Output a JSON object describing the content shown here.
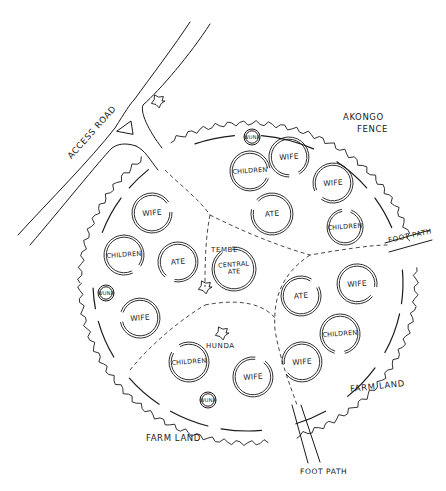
{
  "diagram": {
    "title": "",
    "stroke_color": "#1a1a1a",
    "background": "#ffffff",
    "labels": {
      "access_road": "ACCESS ROAD",
      "akongo_fence_line1": "AKONGO",
      "akongo_fence_line2": "FENCE",
      "foot_path_right": "FOOT PATH",
      "foot_path_bottom": "FOOT PATH",
      "farm_land_right": "FARM LAND",
      "farm_land_bottom": "FARM LAND",
      "tembe": "TEMBE",
      "hunda": "HUNDA"
    },
    "huts": [
      {
        "id": "top-children",
        "label": "CHILDREN",
        "x": 250,
        "y": 171,
        "r": 20
      },
      {
        "id": "top-wife-1",
        "label": "WIFE",
        "x": 289,
        "y": 157,
        "r": 20
      },
      {
        "id": "top-wife-2",
        "label": "WIFE",
        "x": 333,
        "y": 183,
        "r": 20
      },
      {
        "id": "top-ate",
        "label": "ATE",
        "x": 272,
        "y": 214,
        "r": 21
      },
      {
        "id": "top-children-2",
        "label": "CHILDREN",
        "x": 345,
        "y": 227,
        "r": 18
      },
      {
        "id": "left-wife-1",
        "label": "WIFE",
        "x": 152,
        "y": 213,
        "r": 20
      },
      {
        "id": "left-children",
        "label": "CHILDREN",
        "x": 124,
        "y": 255,
        "r": 20
      },
      {
        "id": "left-ate",
        "label": "ATE",
        "x": 178,
        "y": 262,
        "r": 20
      },
      {
        "id": "left-wife-2",
        "label": "WIFE",
        "x": 140,
        "y": 318,
        "r": 20
      },
      {
        "id": "central-ate",
        "label": "CENTRAL ATE",
        "x": 234,
        "y": 269,
        "r": 22
      },
      {
        "id": "right-ate",
        "label": "ATE",
        "x": 301,
        "y": 296,
        "r": 20
      },
      {
        "id": "right-wife-1",
        "label": "WIFE",
        "x": 357,
        "y": 284,
        "r": 20
      },
      {
        "id": "right-children",
        "label": "CHILDREN",
        "x": 340,
        "y": 334,
        "r": 20
      },
      {
        "id": "right-wife-2",
        "label": "WIFE",
        "x": 302,
        "y": 362,
        "r": 20
      },
      {
        "id": "bottom-children",
        "label": "CHILDREN",
        "x": 189,
        "y": 362,
        "r": 20
      },
      {
        "id": "bottom-wife",
        "label": "WIFE",
        "x": 253,
        "y": 377,
        "r": 20
      }
    ],
    "granaries": [
      {
        "id": "top-wuna",
        "label": "WUNA",
        "x": 252,
        "y": 137,
        "r": 8
      },
      {
        "id": "left-wuna",
        "label": "WUNA",
        "x": 106,
        "y": 293,
        "r": 8
      },
      {
        "id": "bottom-wuna",
        "label": "WUNA",
        "x": 208,
        "y": 400,
        "r": 8
      }
    ],
    "trees": [
      {
        "id": "road-tree",
        "x": 158,
        "y": 101
      },
      {
        "id": "tembe-tree",
        "x": 205,
        "y": 287
      },
      {
        "id": "hunda-tree",
        "x": 222,
        "y": 333
      }
    ]
  }
}
